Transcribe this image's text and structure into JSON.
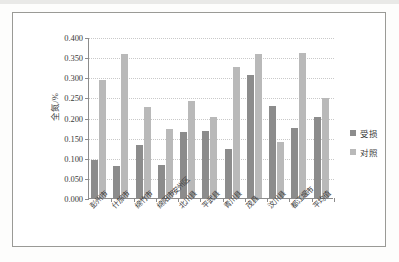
{
  "chart_data": {
    "type": "bar",
    "title": "",
    "xlabel": "",
    "ylabel": "全氮/%",
    "ylim": [
      0,
      0.4
    ],
    "ytick_labels": [
      "0.000",
      "0.050",
      "0.100",
      "0.150",
      "0.200",
      "0.250",
      "0.300",
      "0.350",
      "0.400"
    ],
    "ytick_values": [
      0.0,
      0.05,
      0.1,
      0.15,
      0.2,
      0.25,
      0.3,
      0.35,
      0.4
    ],
    "grid": true,
    "legend_position": "right",
    "categories": [
      "彭州市",
      "什邡市",
      "绵竹市",
      "绵阳市安州区",
      "北川县",
      "平武县",
      "青川县",
      "茂县",
      "汶川县",
      "都江堰市",
      "平均值"
    ],
    "series": [
      {
        "name": "受损",
        "color": "#8c8c8c",
        "values": [
          0.095,
          0.079,
          0.132,
          0.081,
          0.164,
          0.166,
          0.123,
          0.306,
          0.228,
          0.174,
          0.201
        ]
      },
      {
        "name": "对照",
        "color": "#b9b9b9",
        "values": [
          0.293,
          0.357,
          0.227,
          0.172,
          0.242,
          0.201,
          0.325,
          0.357,
          0.138,
          0.361,
          0.249
        ]
      }
    ]
  },
  "colors": {
    "damaged": "#8c8c8c",
    "control": "#b9b9b9",
    "axis": "#8c8c8c",
    "grid": "#c9c9c9",
    "frame": "#9a9a96"
  }
}
